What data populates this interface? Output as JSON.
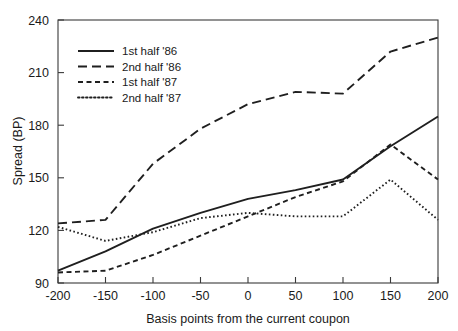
{
  "chart_data": {
    "type": "line",
    "title": "",
    "xlabel": "Basis points from the current coupon",
    "ylabel": "Spread (BP)",
    "xlim": [
      -200,
      200
    ],
    "ylim": [
      90,
      240
    ],
    "xticks": [
      -200,
      -150,
      -100,
      -50,
      0,
      50,
      100,
      150,
      200
    ],
    "xtick_labels": [
      "-200",
      "-150",
      "-100",
      "-50",
      "0",
      "50",
      "100",
      "150",
      "200"
    ],
    "yticks": [
      90,
      120,
      150,
      180,
      210,
      240
    ],
    "ytick_labels": [
      "90",
      "120",
      "150",
      "180",
      "210",
      "240"
    ],
    "grid": false,
    "legend_position": "upper-left-inside",
    "x": [
      -200,
      -150,
      -100,
      -50,
      0,
      50,
      100,
      150,
      200
    ],
    "series": [
      {
        "name": "1st half '86",
        "style": "solid",
        "dasharray": "",
        "values": [
          97,
          108,
          121,
          130,
          138,
          143,
          149,
          168,
          185
        ]
      },
      {
        "name": "2nd half '86",
        "style": "long-dash",
        "dasharray": "9,5",
        "values": [
          124,
          126,
          158,
          178,
          192,
          199,
          198,
          222,
          230
        ]
      },
      {
        "name": "1st half '87",
        "style": "dash",
        "dasharray": "5,3.5",
        "values": [
          96,
          97,
          106,
          117,
          128,
          139,
          148,
          169,
          149
        ]
      },
      {
        "name": "2nd half '87",
        "style": "dotted",
        "dasharray": "1.6,2.4",
        "values": [
          122,
          114,
          119,
          127,
          130,
          128,
          128,
          149,
          126
        ]
      }
    ]
  },
  "legend": {
    "items": [
      {
        "label": "1st half '86"
      },
      {
        "label": "2nd half '86"
      },
      {
        "label": "1st half '87"
      },
      {
        "label": "2nd half '87"
      }
    ]
  },
  "colors": {
    "ink": "#1f1f1f",
    "frame": "#3a3a3a",
    "background": "#ffffff"
  }
}
